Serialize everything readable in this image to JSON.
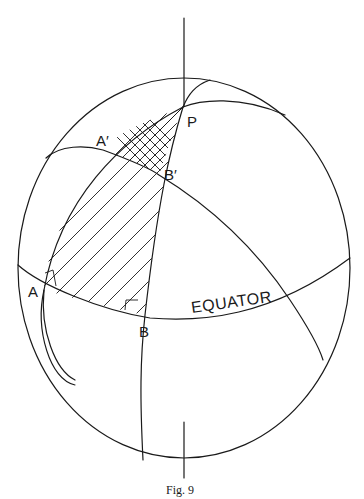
{
  "figure": {
    "caption": "Fig. 9",
    "labels": {
      "pole": "P",
      "a_prime": "A′",
      "b_prime": "B′",
      "a": "A",
      "b": "B",
      "equator": "EQUATOR"
    },
    "colors": {
      "ink": "#1a1a1a",
      "background": "#ffffff"
    }
  }
}
